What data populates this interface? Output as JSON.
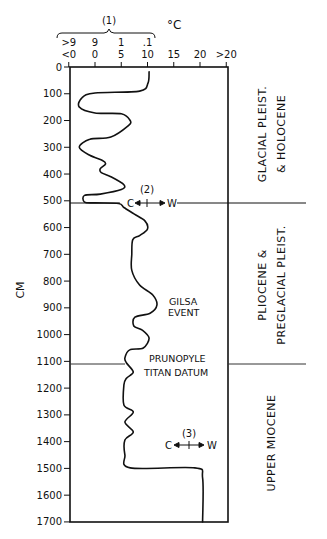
{
  "chart_data": {
    "type": "line",
    "title": "",
    "orientation": "vertical-depth-profile",
    "ylabel": "CM",
    "xlabel": "°C",
    "ylim": [
      0,
      1700
    ],
    "y_inverted": true,
    "y_ticks": [
      0,
      100,
      200,
      300,
      400,
      500,
      600,
      700,
      800,
      900,
      1000,
      1100,
      1200,
      1300,
      1400,
      1500,
      1600,
      1700
    ],
    "x_tick_labels": [
      "<0",
      "0",
      "5",
      "10",
      "15",
      "20",
      ">20"
    ],
    "x_tick_values": [
      -5,
      0,
      5,
      10,
      15,
      20,
      25
    ],
    "scale1_label": "(1)",
    "scale1_tick_labels": [
      ">9",
      "9",
      "1",
      ".1"
    ],
    "scale1_tick_values": [
      -5,
      0,
      5,
      10
    ],
    "unit_label": "°C",
    "grid": false,
    "legend": null,
    "series": [
      {
        "name": "paleotemperature",
        "points": [
          {
            "t": 10.3,
            "d": 18
          },
          {
            "t": 10.1,
            "d": 60
          },
          {
            "t": 8.5,
            "d": 90
          },
          {
            "t": 0,
            "d": 97
          },
          {
            "t": -2.5,
            "d": 115
          },
          {
            "t": -3,
            "d": 150
          },
          {
            "t": 0,
            "d": 172
          },
          {
            "t": 5,
            "d": 175
          },
          {
            "t": 6.7,
            "d": 200
          },
          {
            "t": 6.3,
            "d": 220
          },
          {
            "t": 3,
            "d": 262
          },
          {
            "t": -1,
            "d": 270
          },
          {
            "t": -3,
            "d": 300
          },
          {
            "t": -1,
            "d": 330
          },
          {
            "t": 1.5,
            "d": 350
          },
          {
            "t": 2,
            "d": 362
          },
          {
            "t": 1,
            "d": 380
          },
          {
            "t": 1.2,
            "d": 395
          },
          {
            "t": 3,
            "d": 410
          },
          {
            "t": 5.5,
            "d": 440
          },
          {
            "t": 5,
            "d": 458
          },
          {
            "t": 1,
            "d": 475
          },
          {
            "t": -2,
            "d": 480
          },
          {
            "t": -2,
            "d": 505
          },
          {
            "t": 0,
            "d": 508
          },
          {
            "t": 4.5,
            "d": 510
          },
          {
            "t": 5.5,
            "d": 525
          },
          {
            "t": 7.5,
            "d": 550
          },
          {
            "t": 9.5,
            "d": 575
          },
          {
            "t": 10,
            "d": 605
          },
          {
            "t": 8.5,
            "d": 630
          },
          {
            "t": 7.2,
            "d": 645
          },
          {
            "t": 7,
            "d": 700
          },
          {
            "t": 7,
            "d": 760
          },
          {
            "t": 8.5,
            "d": 815
          },
          {
            "t": 11,
            "d": 852
          },
          {
            "t": 11.8,
            "d": 890
          },
          {
            "t": 10.5,
            "d": 920
          },
          {
            "t": 7.6,
            "d": 935
          },
          {
            "t": 7.4,
            "d": 968
          },
          {
            "t": 9,
            "d": 983
          },
          {
            "t": 10.3,
            "d": 1013
          },
          {
            "t": 9.2,
            "d": 1050
          },
          {
            "t": 6.6,
            "d": 1057
          },
          {
            "t": 5.7,
            "d": 1087
          },
          {
            "t": 6,
            "d": 1106
          },
          {
            "t": 7.3,
            "d": 1140
          },
          {
            "t": 6,
            "d": 1163
          },
          {
            "t": 5.5,
            "d": 1188
          },
          {
            "t": 5.5,
            "d": 1263
          },
          {
            "t": 7.3,
            "d": 1289
          },
          {
            "t": 5.7,
            "d": 1327
          },
          {
            "t": 7.3,
            "d": 1364
          },
          {
            "t": 5.7,
            "d": 1394
          },
          {
            "t": 5.7,
            "d": 1450
          },
          {
            "t": 6.7,
            "d": 1498
          },
          {
            "t": 19,
            "d": 1498
          },
          {
            "t": 20.5,
            "d": 1535
          },
          {
            "t": 20.5,
            "d": 1700
          }
        ]
      }
    ],
    "boundaries": [
      {
        "depth": 509,
        "label": "C ↔ W",
        "marker": "(2)"
      },
      {
        "depth": 1110,
        "label": "PRUNOPYLE TITAN DATUM"
      }
    ],
    "annotations": [
      {
        "text": "GILSA EVENT",
        "t": 14,
        "d": 900
      },
      {
        "text": "PRUNOPYLE",
        "t": 14,
        "d": 1085
      },
      {
        "text": "TITAN DATUM",
        "t": 14,
        "d": 1135
      },
      {
        "text": "(2)",
        "t": 10,
        "d": 465
      },
      {
        "text": "C ↔ W",
        "t": 10,
        "d": 510
      },
      {
        "text": "(3)",
        "t": 16.3,
        "d": 1390
      },
      {
        "text": "C ↔ W",
        "t": 16.3,
        "d": 1440
      }
    ],
    "epochs": [
      {
        "name": "GLACIAL PLEIST. & HOLOCENE",
        "from": 0,
        "to": 509
      },
      {
        "name": "PLIOCENE & PREGLACIAL PLEIST.",
        "from": 509,
        "to": 1110
      },
      {
        "name": "UPPER MIOCENE",
        "from": 1110,
        "to": 1700
      }
    ]
  },
  "labels": {
    "y_axis": "CM",
    "unit": "°C",
    "scale1": "(1)",
    "gilsa1": "GILSA",
    "gilsa2": "EVENT",
    "pruno1": "PRUNOPYLE",
    "pruno2": "TITAN  DATUM",
    "marker2": "(2)",
    "marker3": "(3)",
    "cold": "C",
    "warm": "W",
    "epoch1a": "GLACIAL  PLEIST.",
    "epoch1b": "& HOLOCENE",
    "epoch2a": "PLIOCENE  &",
    "epoch2b": "PREGLACIAL  PLEIST.",
    "epoch3": "UPPER  MIOCENE"
  }
}
